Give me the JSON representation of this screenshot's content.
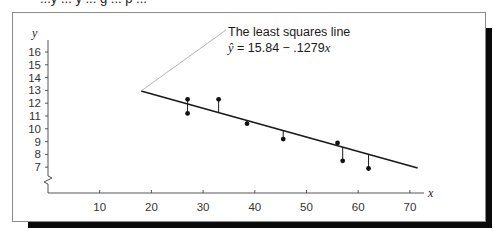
{
  "page": {
    "cut_off_caption": "...y ... y ... g ... p ..."
  },
  "chart_data": {
    "type": "scatter",
    "title": "",
    "xlabel": "x",
    "ylabel": "y",
    "x_ticks": [
      10,
      20,
      30,
      40,
      50,
      60,
      70
    ],
    "y_ticks": [
      7,
      8,
      9,
      10,
      11,
      12,
      13,
      14,
      15,
      16
    ],
    "xlim": [
      0,
      73
    ],
    "ylim": [
      6,
      16.5
    ],
    "y_axis_break": true,
    "grid": false,
    "points": [
      {
        "x": 27,
        "y": 12.3
      },
      {
        "x": 27,
        "y": 11.2
      },
      {
        "x": 33,
        "y": 12.3
      },
      {
        "x": 38.5,
        "y": 10.4
      },
      {
        "x": 45.5,
        "y": 9.2
      },
      {
        "x": 56,
        "y": 8.9
      },
      {
        "x": 57,
        "y": 7.5
      },
      {
        "x": 62,
        "y": 6.9
      }
    ],
    "regression_line": {
      "intercept": 15.84,
      "slope": -0.1279,
      "x_range": [
        18,
        71.5
      ]
    },
    "residual_segments": true,
    "annotation": {
      "line1": "The least squares line",
      "line2_prefix": "ŷ",
      "line2_equation": " = 15.84 − .1279",
      "line2_var": "x"
    }
  },
  "colors": {
    "line": "#1a1a1a",
    "point": "#111111",
    "leader": "#b5b5b5",
    "frame": "#8a8a8a",
    "shadow": "#0a0a0a"
  }
}
